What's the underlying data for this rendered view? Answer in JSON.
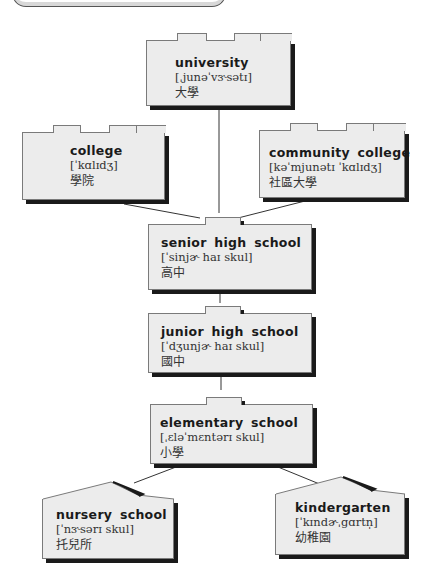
{
  "diagram": {
    "type": "education-system-hierarchy",
    "nodes": [
      {
        "id": "university",
        "english": "university",
        "ipa": "[ˌjunəˈvɝsətɪ]",
        "chinese": "大學"
      },
      {
        "id": "college",
        "english": "college",
        "ipa": "[ˈkɑlɪdʒ]",
        "chinese": "學院"
      },
      {
        "id": "community-college",
        "english": "community  college",
        "ipa": "[kəˈmjunətɪ  ˈkɑlɪdʒ]",
        "chinese": "社區大學"
      },
      {
        "id": "senior-high-school",
        "english": "senior  high  school",
        "ipa": "[ˈsinjɚ  haɪ  skul]",
        "chinese": "高中"
      },
      {
        "id": "junior-high-school",
        "english": "junior  high  school",
        "ipa": "[ˈdʒunjɚ  haɪ  skul]",
        "chinese": "國中"
      },
      {
        "id": "elementary-school",
        "english": "elementary  school",
        "ipa": "[ˌɛləˈmɛntərɪ  skul]",
        "chinese": "小學"
      },
      {
        "id": "nursery-school",
        "english": "nursery  school",
        "ipa": "[ˈnɝsərɪ  skul]",
        "chinese": "托兒所"
      },
      {
        "id": "kindergarten",
        "english": "kindergarten",
        "ipa": "[ˈkɪndɚˌgɑrtn̩]",
        "chinese": "幼稚園"
      }
    ],
    "edges": [
      [
        "senior-high-school",
        "university"
      ],
      [
        "senior-high-school",
        "college"
      ],
      [
        "senior-high-school",
        "community-college"
      ],
      [
        "junior-high-school",
        "senior-high-school"
      ],
      [
        "elementary-school",
        "junior-high-school"
      ],
      [
        "nursery-school",
        "elementary-school"
      ],
      [
        "kindergarten",
        "elementary-school"
      ]
    ]
  },
  "boxes": {
    "university": {
      "en": "university",
      "ipa": "[ˌjunəˈvɝsətɪ]",
      "zh": "大學"
    },
    "college": {
      "en": "college",
      "ipa": "[ˈkɑlɪdʒ]",
      "zh": "學院"
    },
    "community": {
      "en": "community  college",
      "ipa": "[kəˈmjunətɪ  ˈkɑlɪdʒ]",
      "zh": "社區大學"
    },
    "senior": {
      "en": "senior  high  school",
      "ipa": "[ˈsinjɚ  haɪ  skul]",
      "zh": "高中"
    },
    "junior": {
      "en": "junior  high  school",
      "ipa": "[ˈdʒunjɚ  haɪ  skul]",
      "zh": "國中"
    },
    "elementary": {
      "en": "elementary  school",
      "ipa": "[ˌɛləˈmɛntərɪ  skul]",
      "zh": "小學"
    },
    "nursery": {
      "en": "nursery  school",
      "ipa": "[ˈnɝsərɪ  skul]",
      "zh": "托兒所"
    },
    "kindergarten": {
      "en": "kindergarten",
      "ipa": "[ˈkɪndɚˌgɑrtn̩]",
      "zh": "幼稚園"
    }
  },
  "colors": {
    "box_fill": "#ececec",
    "box_border": "#7a7a7a",
    "shadow": "#1a1a1a",
    "connector": "#333333"
  }
}
